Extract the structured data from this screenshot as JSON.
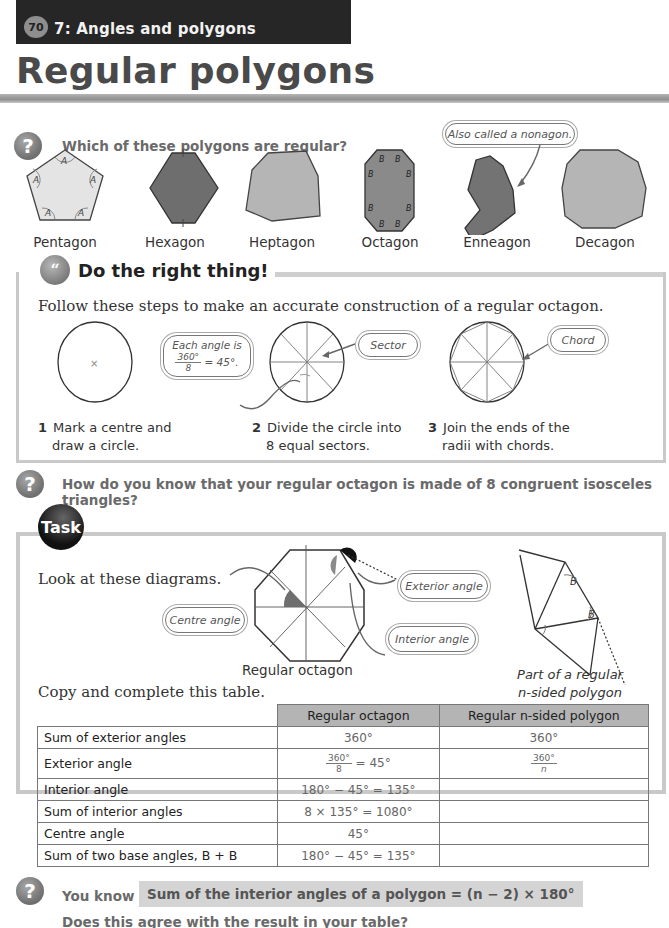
{
  "header": {
    "page_number": "70",
    "chapter": "7: Angles and polygons",
    "title": "Regular polygons"
  },
  "question1": {
    "text": "Which of these polygons are regular?",
    "callout": "Also called a nonagon.",
    "polygons": [
      {
        "name": "Pentagon",
        "angle_label": "A"
      },
      {
        "name": "Hexagon",
        "angle_label": ""
      },
      {
        "name": "Heptagon",
        "angle_label": ""
      },
      {
        "name": "Octagon",
        "angle_label": "B"
      },
      {
        "name": "Enneagon",
        "angle_label": ""
      },
      {
        "name": "Decagon",
        "angle_label": ""
      }
    ]
  },
  "do_right_thing": {
    "title": "Do the right thing!",
    "intro": "Follow these steps to make an accurate construction of a regular octagon.",
    "callouts": {
      "angle_line1": "Each angle is",
      "angle_num": "360°",
      "angle_den": "8",
      "angle_rest": "= 45°.",
      "sector": "Sector",
      "chord": "Chord"
    },
    "steps": [
      {
        "num": "1",
        "line1": "Mark a centre and",
        "line2": "draw a circle."
      },
      {
        "num": "2",
        "line1": "Divide the circle into",
        "line2": "8 equal sectors."
      },
      {
        "num": "3",
        "line1": "Join the ends of the",
        "line2": "radii with chords."
      }
    ]
  },
  "question2": {
    "text": "How do you know that your regular octagon is made of 8 congruent isosceles triangles?"
  },
  "task": {
    "badge": "Task",
    "intro": "Look at these diagrams.",
    "callouts": {
      "centre": "Centre angle",
      "exterior": "Exterior angle",
      "interior": "Interior angle"
    },
    "octagon_caption": "Regular octagon",
    "polygon_caption_line1": "Part of a regular",
    "polygon_caption_line2": "n-sided polygon",
    "base_angle_label": "B",
    "table_intro": "Copy and complete this table.",
    "table": {
      "columns": [
        "",
        "Regular octagon",
        "Regular n-sided polygon"
      ],
      "rows": [
        {
          "label": "Sum of exterior angles",
          "octagon": "360°",
          "n_sided": "360°"
        },
        {
          "label": "Exterior angle",
          "octagon_num": "360°",
          "octagon_den": "8",
          "octagon_rest": "= 45°",
          "n_num": "360°",
          "n_den": "n"
        },
        {
          "label": "Interior angle",
          "octagon": "180° − 45° = 135°",
          "n_sided": ""
        },
        {
          "label": "Sum of interior angles",
          "octagon": "8 × 135° = 1080°",
          "n_sided": ""
        },
        {
          "label": "Centre angle",
          "octagon": "45°",
          "n_sided": ""
        },
        {
          "label": "Sum of two base angles, B + B",
          "octagon": "180° − 45° = 135°",
          "n_sided": ""
        }
      ]
    }
  },
  "question3": {
    "lead": "You know",
    "formula": "Sum of the interior angles of a polygon = (n − 2) × 180°",
    "followup": "Does this agree with the result in your table?"
  },
  "icons": {
    "question": "?",
    "quote": "“"
  }
}
